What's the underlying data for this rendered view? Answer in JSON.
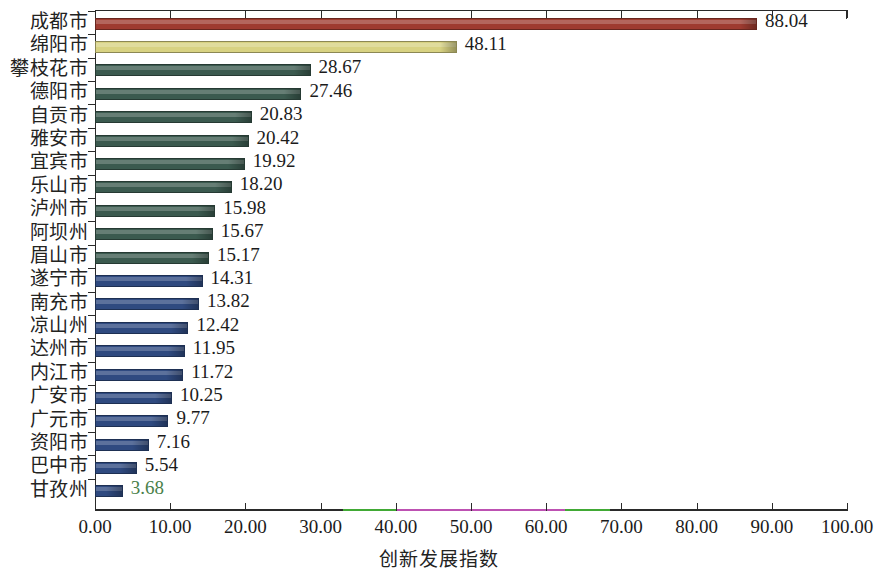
{
  "chart_data": {
    "type": "bar",
    "orientation": "horizontal",
    "title": "",
    "xlabel": "创新发展指数",
    "ylabel": "",
    "xlim": [
      0,
      100
    ],
    "xticks": [
      "0.00",
      "10.00",
      "20.00",
      "30.00",
      "40.00",
      "50.00",
      "60.00",
      "70.00",
      "80.00",
      "90.00",
      "100.00"
    ],
    "xtick_values": [
      0,
      10,
      20,
      30,
      40,
      50,
      60,
      70,
      80,
      90,
      100
    ],
    "grid": false,
    "legend": null,
    "categories": [
      "成都市",
      "绵阳市",
      "攀枝花市",
      "德阳市",
      "自贡市",
      "雅安市",
      "宜宾市",
      "乐山市",
      "泸州市",
      "阿坝州",
      "眉山市",
      "遂宁市",
      "南充市",
      "凉山州",
      "达州市",
      "内江市",
      "广安市",
      "广元市",
      "资阳市",
      "巴中市",
      "甘孜州"
    ],
    "values": [
      88.04,
      48.11,
      28.67,
      27.46,
      20.83,
      20.42,
      19.92,
      18.2,
      15.98,
      15.67,
      15.17,
      14.31,
      13.82,
      12.42,
      11.95,
      11.72,
      10.25,
      9.77,
      7.16,
      5.54,
      3.68
    ],
    "value_labels": [
      "88.04",
      "48.11",
      "28.67",
      "27.46",
      "20.83",
      "20.42",
      "19.92",
      "18.20",
      "15.98",
      "15.67",
      "15.17",
      "14.31",
      "13.82",
      "12.42",
      "11.95",
      "11.72",
      "10.25",
      "9.77",
      "7.16",
      "5.54",
      "3.68"
    ],
    "bar_colors": [
      "#9e3b30",
      "#d8d282",
      "#3b5a4f",
      "#3b5a4f",
      "#3b5a4f",
      "#3b5a4f",
      "#3b5a4f",
      "#3b5a4f",
      "#3b5a4f",
      "#3b5a4f",
      "#3b5a4f",
      "#2f4a80",
      "#2f4a80",
      "#2f4a80",
      "#2f4a80",
      "#2f4a80",
      "#2f4a80",
      "#2f4a80",
      "#2f4a80",
      "#2f4a80",
      "#2f4a80"
    ],
    "axis_tint_segments": [
      {
        "from": 33.0,
        "to": 40.2,
        "color": "#4ad43a"
      },
      {
        "from": 40.2,
        "to": 62.5,
        "color": "#ef5fe0"
      },
      {
        "from": 62.5,
        "to": 68.5,
        "color": "#4ad43a"
      }
    ],
    "tinted_value_labels": [
      "3.68"
    ]
  }
}
